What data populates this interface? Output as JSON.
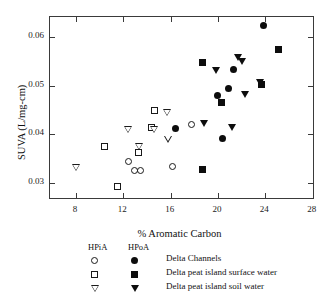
{
  "chart_data": {
    "type": "scatter",
    "title": "",
    "xlabel": "% Aromatic Carbon",
    "ylabel": "SUVA (L/mg-cm)",
    "xlim": [
      5.8,
      28.2
    ],
    "ylim": [
      0.0265,
      0.0641
    ],
    "xticks": [
      8,
      12,
      16,
      20,
      24,
      28
    ],
    "xtick_labels": [
      "8",
      "12",
      "16",
      "20",
      "24",
      "28"
    ],
    "yticks": [
      0.03,
      0.04,
      0.05,
      0.06
    ],
    "ytick_labels": [
      "0.03",
      "0.04",
      "0.05",
      "0.06"
    ],
    "grid": false,
    "legend_position": "below-axes",
    "series": [
      {
        "name": "Delta Channels HPiA",
        "marker": "circle-open",
        "fraction": "HPiA",
        "group": "Delta Channels",
        "points": [
          {
            "x": 12.6,
            "y": 0.034
          },
          {
            "x": 13.1,
            "y": 0.0322
          },
          {
            "x": 13.6,
            "y": 0.0322
          },
          {
            "x": 16.3,
            "y": 0.0331
          },
          {
            "x": 17.9,
            "y": 0.0417
          }
        ]
      },
      {
        "name": "Delta Channels HPoA",
        "marker": "circle-filled",
        "fraction": "HPoA",
        "group": "Delta Channels",
        "points": [
          {
            "x": 16.5,
            "y": 0.0408
          },
          {
            "x": 20.1,
            "y": 0.0476
          },
          {
            "x": 20.5,
            "y": 0.0389
          },
          {
            "x": 21.0,
            "y": 0.049
          },
          {
            "x": 21.4,
            "y": 0.0531
          },
          {
            "x": 24.0,
            "y": 0.062
          }
        ]
      },
      {
        "name": "Delta peat island surface water HPiA",
        "marker": "square-open",
        "fraction": "HPiA",
        "group": "Delta peat island surface water",
        "points": [
          {
            "x": 10.5,
            "y": 0.0371
          },
          {
            "x": 11.6,
            "y": 0.029
          },
          {
            "x": 13.4,
            "y": 0.036
          },
          {
            "x": 14.5,
            "y": 0.041
          },
          {
            "x": 14.8,
            "y": 0.0445
          }
        ]
      },
      {
        "name": "Delta peat island surface water HPoA",
        "marker": "square-filled",
        "fraction": "HPoA",
        "group": "Delta peat island surface water",
        "points": [
          {
            "x": 18.8,
            "y": 0.0325
          },
          {
            "x": 18.8,
            "y": 0.0545
          },
          {
            "x": 20.4,
            "y": 0.0463
          },
          {
            "x": 23.8,
            "y": 0.0499
          },
          {
            "x": 25.2,
            "y": 0.0571
          }
        ]
      },
      {
        "name": "Delta peat island soil water HPiA",
        "marker": "triangle-down-open",
        "fraction": "HPiA",
        "group": "Delta peat island soil water",
        "points": [
          {
            "x": 8.1,
            "y": 0.0331
          },
          {
            "x": 12.5,
            "y": 0.0408
          },
          {
            "x": 13.4,
            "y": 0.0373
          },
          {
            "x": 14.7,
            "y": 0.0408
          },
          {
            "x": 15.9,
            "y": 0.0389
          },
          {
            "x": 15.8,
            "y": 0.0444
          }
        ]
      },
      {
        "name": "Delta peat island soil water HPoA",
        "marker": "triangle-down-filled",
        "fraction": "HPoA",
        "group": "Delta peat island soil water",
        "points": [
          {
            "x": 18.9,
            "y": 0.0421
          },
          {
            "x": 19.9,
            "y": 0.053
          },
          {
            "x": 21.3,
            "y": 0.0412
          },
          {
            "x": 21.8,
            "y": 0.0556
          },
          {
            "x": 22.1,
            "y": 0.0549
          },
          {
            "x": 22.4,
            "y": 0.0481
          },
          {
            "x": 23.6,
            "y": 0.0505
          }
        ]
      }
    ]
  },
  "axes": {
    "x_title": "% Aromatic Carbon",
    "y_title": "SUVA (L/mg-cm)",
    "x_tick_labels": [
      "8",
      "12",
      "16",
      "20",
      "24",
      "28"
    ],
    "y_tick_labels": [
      "0.06",
      "0.05",
      "0.04",
      "0.03"
    ]
  },
  "legend": {
    "header_hpia": "HPiA",
    "header_hpoa": "HPoA",
    "rows": [
      {
        "label": "Delta Channels",
        "open_marker": "circle-open-icon",
        "filled_marker": "circle-filled-icon"
      },
      {
        "label": "Delta peat island surface water",
        "open_marker": "square-open-icon",
        "filled_marker": "square-filled-icon"
      },
      {
        "label": "Delta peat island soil water",
        "open_marker": "triangle-down-open-icon",
        "filled_marker": "triangle-down-filled-icon"
      }
    ]
  },
  "colors": {
    "marker_fill": "#0d0d0d",
    "marker_edge": "#1a1a1a",
    "axis": "#3a3a3a",
    "background": "#ffffff"
  }
}
